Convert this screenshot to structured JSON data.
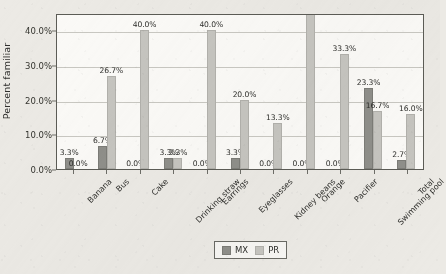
{
  "chart_data": {
    "type": "bar",
    "title": "",
    "xlabel": "",
    "ylabel": "Percent familiar",
    "ylim": [
      0,
      45
    ],
    "ytick_labels": [
      "0.0%",
      "10.0%",
      "20.0%",
      "30.0%",
      "40.0%"
    ],
    "ytick_values": [
      0,
      10,
      20,
      30,
      40
    ],
    "grid": true,
    "legend_position": "bottom-center",
    "categories": [
      "Banana",
      "Bus",
      "Cake",
      "Drinking straw",
      "Earrings",
      "Eyeglasses",
      "Kidney beans",
      "Orange",
      "Pacifier",
      "Swimming pool",
      "Total"
    ],
    "series": [
      {
        "name": "MX",
        "color": "#8f8f8a",
        "values": [
          3.3,
          6.7,
          0.0,
          3.3,
          0.0,
          3.3,
          0.0,
          0.0,
          0.0,
          23.3,
          2.7
        ],
        "labels": [
          "3.3%",
          "6.7%",
          "0.0%",
          "3.3%",
          "0.0%",
          "3.3%",
          "0.0%",
          "0.0%",
          "0.0%",
          "23.3%",
          "2.7%"
        ]
      },
      {
        "name": "PR",
        "color": "#c6c5c0",
        "values": [
          0.0,
          26.7,
          40.0,
          3.3,
          40.0,
          20.0,
          13.3,
          46.7,
          33.3,
          16.7,
          16.0
        ],
        "labels": [
          "0.0%",
          "26.7%",
          "40.0%",
          "3.3%",
          "40.0%",
          "20.0%",
          "13.3%",
          "46.7%",
          "33.3%",
          "16.7%",
          "16.0%"
        ]
      }
    ]
  },
  "legend": {
    "items": [
      {
        "label": "MX",
        "swatch": "mx"
      },
      {
        "label": "PR",
        "swatch": "pr"
      }
    ]
  }
}
